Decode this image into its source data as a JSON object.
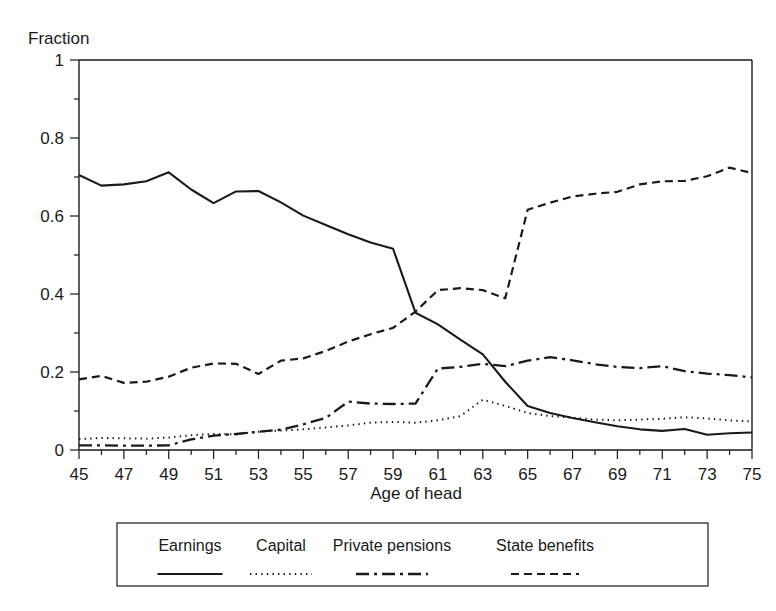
{
  "chart_data": {
    "type": "line",
    "title": "",
    "xlabel": "Age of head",
    "ylabel": "Fraction",
    "xlim": [
      45,
      75
    ],
    "ylim": [
      0,
      1
    ],
    "grid": false,
    "legend_position": "bottom",
    "x_major_ticks": [
      45,
      47,
      49,
      51,
      53,
      55,
      57,
      59,
      61,
      63,
      65,
      67,
      69,
      71,
      73,
      75
    ],
    "x_minor_ticks": [
      46,
      48,
      50,
      52,
      54,
      56,
      58,
      60,
      62,
      64,
      66,
      68,
      70,
      72,
      74
    ],
    "y_major_ticks": [
      0,
      0.2,
      0.4,
      0.6,
      0.8,
      1
    ],
    "y_major_tick_labels": [
      "0",
      "0.2",
      "0.4",
      "0.6",
      "0.8",
      "1"
    ],
    "y_minor_ticks": [
      0.1,
      0.3,
      0.5,
      0.7,
      0.9
    ],
    "x": [
      45,
      46,
      47,
      48,
      49,
      50,
      51,
      52,
      53,
      54,
      55,
      56,
      57,
      58,
      59,
      60,
      61,
      62,
      63,
      64,
      65,
      66,
      67,
      68,
      69,
      70,
      71,
      72,
      73,
      74,
      75
    ],
    "series": [
      {
        "name": "Earnings",
        "style": "solid",
        "values": [
          0.705,
          0.678,
          0.681,
          0.689,
          0.712,
          0.668,
          0.633,
          0.663,
          0.664,
          0.635,
          0.601,
          0.577,
          0.553,
          0.532,
          0.516,
          0.352,
          0.322,
          0.283,
          0.245,
          0.175,
          0.113,
          0.095,
          0.082,
          0.071,
          0.061,
          0.053,
          0.049,
          0.054,
          0.039,
          0.043,
          0.045
        ]
      },
      {
        "name": "Capital",
        "style": "dotted",
        "values": [
          0.028,
          0.031,
          0.03,
          0.029,
          0.032,
          0.038,
          0.041,
          0.04,
          0.047,
          0.05,
          0.053,
          0.058,
          0.063,
          0.07,
          0.072,
          0.07,
          0.076,
          0.087,
          0.129,
          0.113,
          0.095,
          0.087,
          0.083,
          0.078,
          0.076,
          0.078,
          0.08,
          0.084,
          0.081,
          0.076,
          0.073
        ]
      },
      {
        "name": "Private pensions",
        "style": "dashdot",
        "values": [
          0.012,
          0.012,
          0.011,
          0.011,
          0.012,
          0.027,
          0.037,
          0.041,
          0.047,
          0.052,
          0.066,
          0.082,
          0.124,
          0.119,
          0.118,
          0.119,
          0.209,
          0.213,
          0.221,
          0.215,
          0.229,
          0.238,
          0.23,
          0.22,
          0.213,
          0.21,
          0.215,
          0.202,
          0.196,
          0.192,
          0.186
        ]
      },
      {
        "name": "State benefits",
        "style": "dashed",
        "values": [
          0.181,
          0.19,
          0.172,
          0.175,
          0.188,
          0.211,
          0.222,
          0.221,
          0.195,
          0.229,
          0.235,
          0.254,
          0.278,
          0.297,
          0.313,
          0.355,
          0.41,
          0.415,
          0.41,
          0.389,
          0.616,
          0.634,
          0.65,
          0.657,
          0.662,
          0.681,
          0.689,
          0.69,
          0.702,
          0.724,
          0.71
        ]
      }
    ]
  },
  "legend": {
    "entries": [
      {
        "label": "Earnings",
        "style": "solid"
      },
      {
        "label": "Capital",
        "style": "dotted"
      },
      {
        "label": "Private pensions",
        "style": "dashdot"
      },
      {
        "label": "State benefits",
        "style": "dashed"
      }
    ]
  },
  "colors": {
    "ink": "#1a1a1a",
    "background": "#ffffff"
  }
}
